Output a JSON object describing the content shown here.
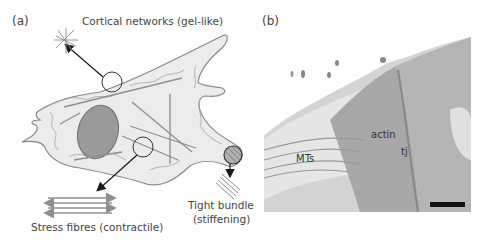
{
  "panel_a": {
    "label": "(a)",
    "callouts": {
      "cortical": "Cortical networks (gel-like)",
      "stress": "Stress fibres (contractile)",
      "tight_line1": "Tight bundle",
      "tight_line2": "(stiffening)"
    }
  },
  "panel_b": {
    "label": "(b)",
    "annotations": {
      "actin": "actin",
      "tj": "tj",
      "mts": "MTs"
    }
  },
  "colors": {
    "cell_fill": "#ececec",
    "cell_outline": "#8a8a8a",
    "nucleus_fill": "#9a9a9a",
    "fibre": "#8f8f8f",
    "arrow": "#1a1a1a",
    "text": "#444444"
  }
}
